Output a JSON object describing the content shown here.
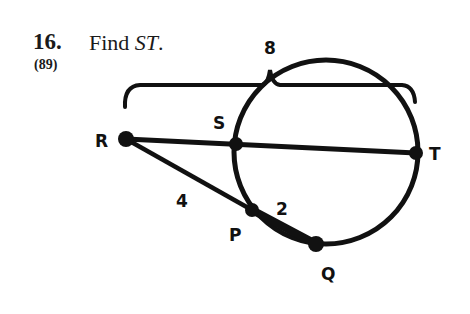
{
  "problem": {
    "number": "16.",
    "lesson_ref": "(89)",
    "prompt_prefix": "Find ",
    "prompt_var": "ST",
    "prompt_suffix": "."
  },
  "diagram": {
    "points": {
      "R": "R",
      "S": "S",
      "T": "T",
      "P": "P",
      "Q": "Q"
    },
    "measures": {
      "RT_brace": "8",
      "RP": "4",
      "PQ": "2"
    },
    "stroke_color": "#111111"
  }
}
